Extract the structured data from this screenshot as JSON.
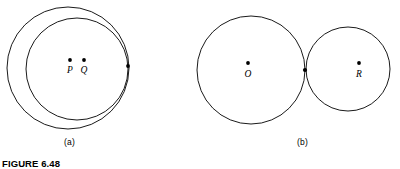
{
  "figure": {
    "caption": "FIGURE 6.48",
    "background_color": "#ffffff",
    "stroke_color": "#000000"
  },
  "panels": [
    {
      "id": "a",
      "label": "(a)",
      "description": "internally tangent circles",
      "circles": [
        {
          "name": "outer-circle",
          "cx": 68,
          "cy": 68,
          "r": 61,
          "stroke_width": 0.9
        },
        {
          "name": "inner-circle",
          "cx": 77,
          "cy": 69,
          "r": 51,
          "stroke_width": 0.9
        }
      ],
      "points": [
        {
          "name": "P",
          "label": "P",
          "cx": 70,
          "cy": 60,
          "r": 1.9,
          "label_x": 70,
          "label_y": 73
        },
        {
          "name": "Q",
          "label": "Q",
          "cx": 84,
          "cy": 60,
          "r": 1.9,
          "label_x": 84,
          "label_y": 73
        },
        {
          "name": "tangent-point-a",
          "label": "",
          "cx": 128,
          "cy": 66,
          "r": 1.9,
          "label_x": 0,
          "label_y": 0
        }
      ]
    },
    {
      "id": "b",
      "label": "(b)",
      "description": "externally tangent circles",
      "circles": [
        {
          "name": "circle-o",
          "cx": 251,
          "cy": 70,
          "r": 54,
          "stroke_width": 0.9
        },
        {
          "name": "circle-r",
          "cx": 348,
          "cy": 69,
          "r": 42,
          "stroke_width": 0.9
        }
      ],
      "points": [
        {
          "name": "O",
          "label": "O",
          "cx": 248,
          "cy": 63,
          "r": 1.9,
          "label_x": 248,
          "label_y": 77
        },
        {
          "name": "R",
          "label": "R",
          "cx": 359,
          "cy": 63,
          "r": 1.9,
          "label_x": 359,
          "label_y": 77
        },
        {
          "name": "tangent-point-b",
          "label": "",
          "cx": 305,
          "cy": 70,
          "r": 2.1,
          "label_x": 0,
          "label_y": 0
        }
      ]
    }
  ]
}
